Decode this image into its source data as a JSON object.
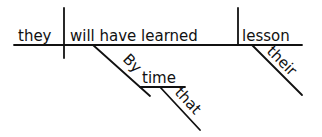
{
  "diagram": {
    "type": "sentence-diagram",
    "words": {
      "subject": "they",
      "verb": "will have learned",
      "object": "lesson",
      "object_modifier": "their",
      "preposition": "By",
      "prep_object": "time",
      "prep_object_modifier": "that"
    },
    "colors": {
      "ink": "#111111",
      "background": "#ffffff"
    }
  }
}
